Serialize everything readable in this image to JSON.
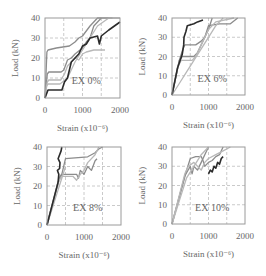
{
  "figure": {
    "layout": "2x2 grid",
    "xlabel": "Strain (x10⁻⁶)",
    "ylabel": "Load (kN)",
    "xticks": [
      "0",
      "1000",
      "2000"
    ],
    "yticks": [
      "0",
      "10",
      "20",
      "30",
      "40"
    ],
    "colors": {
      "axis": "#9a9a9a",
      "grid": "#bdbdbd",
      "series_dark": "#2b2b2b",
      "series_mid": "#8c8c8c",
      "series_light": "#b8b8b8"
    }
  },
  "chart_data": [
    {
      "type": "line",
      "title": "",
      "annotation": "EX 0%",
      "xlabel": "Strain (x10⁻⁶)",
      "ylabel": "Load (kN)",
      "xlim": [
        0,
        2000
      ],
      "ylim": [
        0,
        40
      ],
      "xticks": [
        0,
        1000,
        2000
      ],
      "yticks": [
        0,
        10,
        20,
        30,
        40
      ],
      "grid": "dashed at x=500,1000,1500 and y=10,20,30",
      "legend": "none",
      "series": [
        {
          "name": "gauge-1",
          "color": "dark",
          "x": [
            0,
            80,
            120,
            450,
            520,
            600,
            700,
            900,
            1000,
            1100,
            1200,
            1400,
            1450,
            1500,
            1700,
            2000
          ],
          "y": [
            0,
            4,
            4,
            4,
            8,
            10,
            18,
            22,
            26,
            27,
            30,
            31,
            27,
            31,
            34,
            38
          ]
        },
        {
          "name": "gauge-2",
          "color": "mid",
          "x": [
            0,
            50,
            80,
            300,
            650,
            800,
            900,
            1000,
            1200,
            1400,
            1600,
            1800
          ],
          "y": [
            0,
            23,
            24,
            25,
            26,
            28,
            30,
            31,
            36,
            40,
            40,
            40
          ]
        },
        {
          "name": "gauge-3",
          "color": "mid",
          "x": [
            0,
            60,
            100,
            430,
            500,
            600,
            700,
            800,
            1000,
            1100,
            1200,
            1300,
            1500
          ],
          "y": [
            0,
            12,
            13,
            13,
            14,
            19,
            20,
            22,
            25,
            28,
            30,
            36,
            40
          ]
        },
        {
          "name": "gauge-4",
          "color": "light",
          "x": [
            0,
            60,
            100,
            420,
            520,
            600,
            700,
            800,
            900,
            1000,
            1100,
            1300,
            1500,
            1600
          ],
          "y": [
            0,
            8,
            9,
            9,
            12,
            16,
            18,
            20,
            19,
            22,
            23,
            24,
            24,
            24
          ]
        },
        {
          "name": "gauge-5",
          "color": "light",
          "x": [
            0,
            40,
            80,
            400,
            600,
            800,
            1000,
            1200,
            1400,
            1700,
            2000
          ],
          "y": [
            0,
            6,
            7,
            7,
            10,
            18,
            24,
            30,
            36,
            40,
            40
          ]
        }
      ]
    },
    {
      "type": "line",
      "title": "",
      "annotation": "EX 6%",
      "xlabel": "Strain (x10⁻⁶)",
      "ylabel": "Load (kN)",
      "xlim": [
        0,
        2000
      ],
      "ylim": [
        0,
        40
      ],
      "xticks": [
        0,
        1000,
        2000
      ],
      "yticks": [
        0,
        10,
        20,
        30,
        40
      ],
      "grid": "dashed at x=500,1000,1500 and y=10,20,30",
      "legend": "none",
      "series": [
        {
          "name": "gauge-1",
          "color": "dark",
          "x": [
            0,
            150,
            280,
            320,
            330,
            380,
            420,
            600,
            700,
            850
          ],
          "y": [
            0,
            14,
            21,
            26,
            30,
            33,
            36,
            37,
            38,
            39
          ]
        },
        {
          "name": "gauge-2",
          "color": "mid",
          "x": [
            0,
            200,
            300,
            350,
            650,
            800,
            900,
            1000,
            1300,
            1600,
            1800
          ],
          "y": [
            0,
            18,
            24,
            26,
            26,
            28,
            30,
            36,
            37,
            37,
            40
          ]
        },
        {
          "name": "gauge-3",
          "color": "mid",
          "x": [
            0,
            200,
            280,
            600,
            700,
            800,
            900,
            1000,
            1100
          ],
          "y": [
            0,
            18,
            20,
            20,
            22,
            26,
            30,
            34,
            40
          ]
        },
        {
          "name": "gauge-4",
          "color": "light",
          "x": [
            0,
            150,
            250,
            550,
            650,
            800,
            900,
            1000,
            1200,
            1700
          ],
          "y": [
            0,
            14,
            18,
            18,
            20,
            26,
            30,
            34,
            38,
            40
          ]
        },
        {
          "name": "gauge-5",
          "color": "light",
          "x": [
            0,
            200,
            400,
            600,
            800,
            1000,
            1200,
            1400
          ],
          "y": [
            0,
            6,
            12,
            18,
            24,
            30,
            36,
            40
          ]
        }
      ]
    },
    {
      "type": "line",
      "title": "",
      "annotation": "EX 8%",
      "xlabel": "Strain (x10⁻⁶)",
      "ylabel": "Load (kN)",
      "xlim": [
        0,
        2000
      ],
      "ylim": [
        0,
        40
      ],
      "xticks": [
        0,
        1000,
        2000
      ],
      "yticks": [
        0,
        10,
        20,
        30,
        40
      ],
      "grid": "dashed at x=500,1000,1500 and y=10,20,30",
      "legend": "none",
      "series": [
        {
          "name": "gauge-1",
          "color": "dark",
          "x": [
            0,
            300,
            320,
            280,
            340,
            350,
            300,
            380,
            400
          ],
          "y": [
            0,
            22,
            26,
            28,
            29,
            32,
            34,
            38,
            40
          ]
        },
        {
          "name": "gauge-2",
          "color": "mid",
          "x": [
            0,
            300,
            400,
            500,
            1100,
            1200,
            1300,
            1400,
            1500
          ],
          "y": [
            0,
            22,
            26,
            34,
            35,
            36,
            37,
            39,
            40
          ]
        },
        {
          "name": "gauge-3",
          "color": "mid",
          "x": [
            0,
            350,
            400,
            800,
            850,
            900,
            1000,
            1100,
            1200,
            1300,
            1350
          ],
          "y": [
            0,
            25,
            26,
            26,
            24,
            28,
            26,
            30,
            28,
            33,
            34
          ]
        },
        {
          "name": "gauge-4",
          "color": "light",
          "x": [
            0,
            300,
            400,
            700,
            800,
            900,
            1000,
            1100,
            1300,
            1400
          ],
          "y": [
            0,
            22,
            25,
            25,
            23,
            26,
            28,
            32,
            36,
            40
          ]
        },
        {
          "name": "gauge-5",
          "color": "light",
          "x": [
            0,
            100,
            200,
            300,
            400,
            500
          ],
          "y": [
            0,
            6,
            12,
            18,
            24,
            30
          ]
        }
      ]
    },
    {
      "type": "line",
      "title": "",
      "annotation": "EX 10%",
      "xlabel": "Strain (x10⁻⁶)",
      "ylabel": "Load (kN)",
      "xlim": [
        0,
        2000
      ],
      "ylim": [
        0,
        40
      ],
      "xticks": [
        0,
        1000,
        2000
      ],
      "yticks": [
        0,
        10,
        20,
        30,
        40
      ],
      "grid": "dashed at x=500,1000,1500 and y=10,20,30",
      "legend": "none",
      "series": [
        {
          "name": "gauge-1",
          "color": "dark",
          "x": [
            1000,
            1050,
            1100,
            1150,
            1200,
            1250,
            1300,
            1350,
            1400
          ],
          "y": [
            26,
            28,
            27,
            30,
            29,
            32,
            31,
            34,
            35
          ]
        },
        {
          "name": "gauge-2",
          "color": "mid",
          "x": [
            0,
            400,
            500,
            650,
            800,
            850,
            900,
            1000,
            1100,
            1200,
            1300,
            1400
          ],
          "y": [
            0,
            28,
            34,
            35,
            35,
            33,
            30,
            32,
            33,
            35,
            36,
            40
          ]
        },
        {
          "name": "gauge-3",
          "color": "mid",
          "x": [
            0,
            350,
            500,
            550,
            600,
            700,
            800,
            900,
            1000
          ],
          "y": [
            0,
            25,
            30,
            26,
            30,
            28,
            32,
            36,
            40
          ]
        },
        {
          "name": "gauge-4",
          "color": "light",
          "x": [
            0,
            350,
            450,
            600,
            700,
            800,
            900,
            1000,
            1200,
            1400,
            1600
          ],
          "y": [
            0,
            26,
            30,
            32,
            30,
            28,
            32,
            34,
            36,
            38,
            40
          ]
        },
        {
          "name": "gauge-5",
          "color": "light",
          "x": [
            0,
            200,
            400,
            600,
            800,
            1000
          ],
          "y": [
            0,
            12,
            24,
            30,
            36,
            40
          ]
        }
      ]
    }
  ]
}
